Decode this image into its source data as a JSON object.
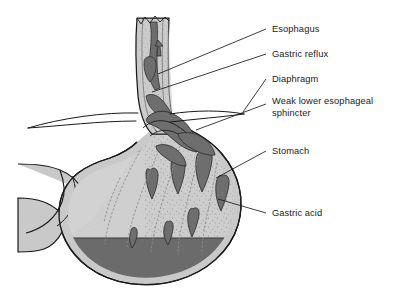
{
  "figure": {
    "type": "medical-anatomical-diagram",
    "background_color": "#ffffff",
    "colors": {
      "outline": "#1a1a1a",
      "wall_light": "#c9c9c9",
      "wall_mid": "#b3b3b3",
      "reflux_dark": "#6e6e6e",
      "acid_pool": "#6b6b6b",
      "lumen_white": "#ffffff",
      "label_text": "#1a1a1a",
      "leader_line": "#1a1a1a"
    }
  },
  "labels": {
    "esophagus": "Esophagus",
    "gastric_reflux": "Gastric reflux",
    "diaphragm": "Diaphragm",
    "weak_lower_esophageal_sphincter": "Weak lower esophageal\nsphincter",
    "stomach": "Stomach",
    "gastric_acid": "Gastric acid"
  },
  "structures": [
    {
      "name": "esophagus",
      "description": "vertical tube at upper center with muscular walls"
    },
    {
      "name": "gastric-reflux",
      "description": "dark acid blobs rising inside the esophagus"
    },
    {
      "name": "diaphragm",
      "description": "thin tapering double curve crossing the esophagus"
    },
    {
      "name": "lower-esophageal-sphincter",
      "description": "weak junction allowing reflux upward"
    },
    {
      "name": "stomach",
      "description": "large curved sac with rugae and stippled mucosa"
    },
    {
      "name": "gastric-acid",
      "description": "dark pool of acid at base of stomach"
    },
    {
      "name": "duodenum",
      "description": "outlet at lower left, cropped by frame"
    }
  ]
}
